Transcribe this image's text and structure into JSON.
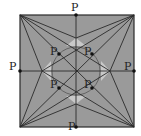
{
  "diagram": {
    "type": "geometric-construction",
    "colors": {
      "fill": "#9a9a9a",
      "line": "#2a2a2a",
      "light": "#c8c8c8",
      "background": "#ffffff"
    },
    "square": {
      "x1": 20,
      "y1": 15,
      "x2": 134,
      "y2": 127
    },
    "center": {
      "x": 76,
      "y": 71
    },
    "circle_radius": 24,
    "points": [
      {
        "label": "P",
        "x": 76,
        "y": 15,
        "lx": 71,
        "ly": 11
      },
      {
        "label": "P",
        "x": 134,
        "y": 71,
        "lx": 124,
        "ly": 70
      },
      {
        "label": "P",
        "x": 76,
        "y": 127,
        "lx": 68,
        "ly": 130
      },
      {
        "label": "P",
        "x": 20,
        "y": 71,
        "lx": 9,
        "ly": 70
      },
      {
        "label": "P",
        "x": 59,
        "y": 54,
        "lx": 50,
        "ly": 55
      },
      {
        "label": "P",
        "x": 92,
        "y": 54,
        "lx": 84,
        "ly": 55
      },
      {
        "label": "P",
        "x": 59,
        "y": 88,
        "lx": 50,
        "ly": 88
      },
      {
        "label": "P",
        "x": 92,
        "y": 88,
        "lx": 84,
        "ly": 88
      }
    ]
  }
}
